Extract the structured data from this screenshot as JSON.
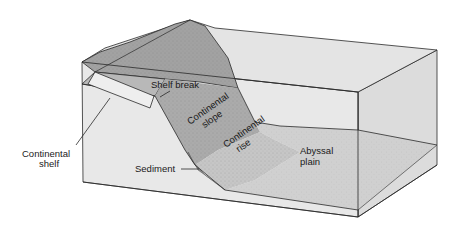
{
  "diagram": {
    "type": "block-diagram",
    "colors": {
      "background": "#ffffff",
      "box_face_front": "#e6e6e6",
      "box_face_right": "#dadada",
      "water_top": "#e2e2e2",
      "land_top": "#9c9c9c",
      "shelf": "#b4b4b4",
      "slope": "#a8a8a8",
      "rise": "#c4c4c4",
      "abyssal_plain": "#cfcfcf",
      "sediment": "#8c8c8c",
      "line": "#2a2a2a"
    },
    "labels": {
      "shelf_break": "Shelf break",
      "continental_slope_1": "Continental",
      "continental_slope_2": "slope",
      "continental_rise_1": "Continental",
      "continental_rise_2": "rise",
      "abyssal_plain_1": "Abyssal",
      "abyssal_plain_2": "plain",
      "continental_shelf_1": "Continental",
      "continental_shelf_2": "shelf",
      "sediment": "Sediment"
    }
  }
}
